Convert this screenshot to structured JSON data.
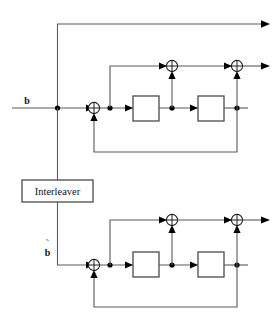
{
  "figure": {
    "kind": "block-diagram",
    "title": "",
    "background_color": "#ffffff",
    "wire_color": "#5a5a5a",
    "ink_color": "#111111"
  },
  "labels": {
    "input_top": "b",
    "input_bottom": "b",
    "input_bottom_accent": "˜",
    "interleaver": "Interleaver"
  },
  "blocks": [
    {
      "id": "delay-top-1",
      "label": "",
      "name": "delay-element"
    },
    {
      "id": "delay-top-2",
      "label": "",
      "name": "delay-element"
    },
    {
      "id": "delay-bottom-1",
      "label": "",
      "name": "delay-element"
    },
    {
      "id": "delay-bottom-2",
      "label": "",
      "name": "delay-element"
    },
    {
      "id": "interleaver",
      "label": "Interleaver",
      "name": "interleaver-block"
    }
  ],
  "adders": [
    {
      "id": "xor-top-input",
      "symbol": "⊕"
    },
    {
      "id": "xor-top-mid",
      "symbol": "⊕"
    },
    {
      "id": "xor-top-out",
      "symbol": "⊕"
    },
    {
      "id": "xor-bottom-input",
      "symbol": "⊕"
    },
    {
      "id": "xor-bottom-mid",
      "symbol": "⊕"
    },
    {
      "id": "xor-bottom-out",
      "symbol": "⊕"
    }
  ],
  "outputs": [
    {
      "id": "systematic-output",
      "label": ""
    },
    {
      "id": "parity-1-output",
      "label": ""
    },
    {
      "id": "parity-2-output",
      "label": ""
    }
  ]
}
